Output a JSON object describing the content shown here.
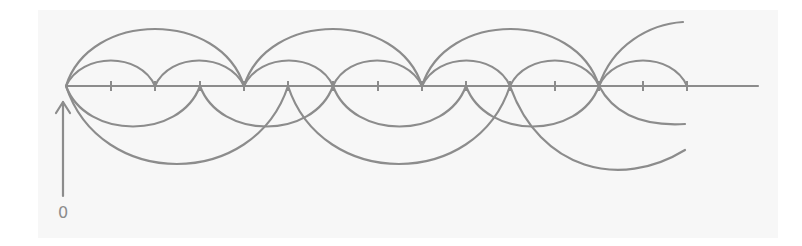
{
  "diagram": {
    "type": "number-line-hops",
    "stroke_color": "#8c8c8c",
    "background_color": "#f7f7f7",
    "origin_label": "0",
    "axis": {
      "y": 86,
      "x_start": 66,
      "x_end": 758,
      "unit_px": 44.4,
      "tick_count": 14
    },
    "ticks_x": [
      111,
      155,
      200,
      244,
      288,
      333,
      378,
      422,
      466,
      510,
      555,
      599,
      643,
      687
    ],
    "hop_series": [
      {
        "name": "jumps of 4 (above, large)",
        "position": "above",
        "step": 4,
        "landings": [
          0,
          4,
          8,
          12
        ],
        "partial_end": 13.9
      },
      {
        "name": "jumps of 2 (above, small)",
        "position": "above",
        "step": 2,
        "landings": [
          0,
          2,
          4,
          6,
          8,
          10,
          12,
          14
        ]
      },
      {
        "name": "jumps of 3 (below, small)",
        "position": "below",
        "step": 3,
        "landings": [
          0,
          3,
          6,
          9,
          12
        ],
        "partial_end": 13.9
      },
      {
        "name": "jumps of 5 (below, large)",
        "position": "below",
        "step": 5,
        "landings": [
          0,
          5,
          10
        ],
        "partial_end": 13.9
      }
    ],
    "arrow": {
      "direction": "up",
      "points_to": "origin",
      "from_label": "0"
    }
  }
}
